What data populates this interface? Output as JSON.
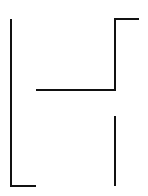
{
  "diagram": {
    "canvas": {
      "width": 148,
      "height": 196,
      "background": "#ffffff"
    },
    "stroke": {
      "color": "#111111",
      "width": 2
    },
    "segments": [
      {
        "id": "left-bracket",
        "points": "11,19 11,186 36,186"
      },
      {
        "id": "upper-right-step",
        "points": "36,90 115,90 115,19 139,19"
      },
      {
        "id": "lower-right-line",
        "points": "115,116 115,186"
      }
    ]
  }
}
